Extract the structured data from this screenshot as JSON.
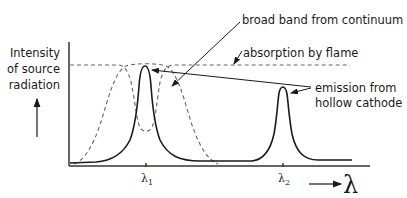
{
  "diagram": {
    "y_axis_label": [
      "Intensity",
      "of source",
      "radiation"
    ],
    "x_axis_symbol": "λ",
    "ticks": {
      "lambda1": {
        "base": "λ",
        "sub": "1"
      },
      "lambda2": {
        "base": "λ",
        "sub": "2"
      }
    },
    "annotations": {
      "broad_band": "broad band from continuum",
      "absorption": "absorption by flame",
      "emission_line1": "emission from",
      "emission_line2": "hollow cathode"
    },
    "curves": [
      {
        "name": "emission-hollow-cathode",
        "style": "solid",
        "peaks_at": [
          "λ1",
          "λ2"
        ]
      },
      {
        "name": "absorption-by-flame",
        "style": "dashed",
        "dip_at": "λ1"
      },
      {
        "name": "broad-band-continuum",
        "style": "dashed",
        "centered_at": "λ1"
      }
    ],
    "colors": {
      "line": "#1a1a1a",
      "dashed": "#555555"
    }
  }
}
